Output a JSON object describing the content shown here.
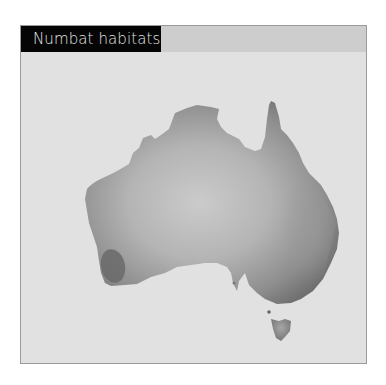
{
  "figure": {
    "title": "Numbat habitats"
  },
  "map": {
    "region": "Australia",
    "highlight": "Numbat habitat (south-west Western Australia)",
    "colors": {
      "background": "#e1e1e1",
      "land_dark": "#6e6e6e",
      "land_light": "#c8c8c8",
      "habitat": "#6a6a6a",
      "title_bg": "#050505",
      "header_bg": "#cdcdcd"
    }
  }
}
